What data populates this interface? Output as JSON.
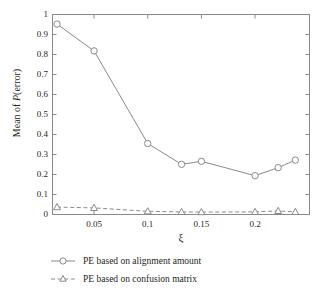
{
  "chart_data": {
    "type": "line",
    "title": "",
    "xlabel": "ξ",
    "ylabel": "Mean of P(error)",
    "xlim": [
      0.0113,
      0.2507
    ],
    "ylim": [
      0,
      1
    ],
    "grid": false,
    "legend_position": "below-plot",
    "xticks": [
      0.05,
      0.1,
      0.15,
      0.2
    ],
    "xtick_labels": [
      "0.05",
      "0.1",
      "0.15",
      "0.2"
    ],
    "yticks": [
      0,
      0.1,
      0.2,
      0.3,
      0.4,
      0.5,
      0.6,
      0.7,
      0.8,
      0.9,
      1
    ],
    "ytick_labels": [
      "0",
      "0.1",
      "0.2",
      "0.3",
      "0.4",
      "0.5",
      "0.6",
      "0.7",
      "0.8",
      "0.9",
      "1"
    ],
    "x": [
      0.0155,
      0.05,
      0.1,
      0.1315,
      0.15,
      0.2,
      0.2215,
      0.2375
    ],
    "series": [
      {
        "name": "PE based on alignment amount",
        "marker": "circle",
        "linestyle": "solid",
        "color": "#8a8a8a",
        "values": [
          0.952,
          0.818,
          0.355,
          0.251,
          0.266,
          0.194,
          0.234,
          0.272
        ]
      },
      {
        "name": "PE based on confusion matrix",
        "marker": "triangle",
        "linestyle": "dashed",
        "color": "#8a8a8a",
        "values": [
          0.037,
          0.033,
          0.016,
          0.013,
          0.012,
          0.013,
          0.018,
          0.013
        ]
      }
    ]
  },
  "legend": {
    "items": [
      {
        "label": "PE based on alignment amount"
      },
      {
        "label": "PE based on confusion matrix"
      }
    ]
  },
  "axes": {
    "y_axis_label": "Mean of ",
    "y_axis_label_italic": "P",
    "y_axis_label_tail": "(error)",
    "x_axis_label": "ξ"
  }
}
